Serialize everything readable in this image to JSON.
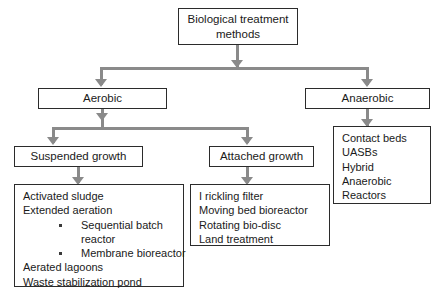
{
  "diagram": {
    "root": {
      "label": "Biological treatment\nmethods",
      "line1": "Biological treatment",
      "line2": "methods"
    },
    "branches": {
      "aerobic": {
        "label": "Aerobic"
      },
      "anaerobic": {
        "label": "Anaerobic"
      }
    },
    "aerobic_children": {
      "suspended": {
        "label": "Suspended growth"
      },
      "attached": {
        "label": "Attached growth"
      }
    },
    "suspended_growth_items": [
      {
        "text": "Activated sludge",
        "bullet": false
      },
      {
        "text": "Extended aeration",
        "bullet": false
      },
      {
        "text": "Sequential batch",
        "bullet": true
      },
      {
        "text": "reactor",
        "bullet": false,
        "continuation": true
      },
      {
        "text": "Membrane bioreactor",
        "bullet": true
      },
      {
        "text": "Aerated lagoons",
        "bullet": false
      },
      {
        "text": "Waste stabilization pond",
        "bullet": false
      }
    ],
    "attached_growth_items": [
      {
        "text": "I rickling filter",
        "bullet": false
      },
      {
        "text": "Moving bed bioreactor",
        "bullet": false
      },
      {
        "text": "Rotating bio-disc",
        "bullet": false
      },
      {
        "text": "Land treatment",
        "bullet": false
      }
    ],
    "anaerobic_items": [
      {
        "text": "Contact beds",
        "bullet": false
      },
      {
        "text": "UASBs",
        "bullet": false
      },
      {
        "text": "Hybrid",
        "bullet": false
      },
      {
        "text": "Anaerobic",
        "bullet": false
      },
      {
        "text": "Reactors",
        "bullet": false
      }
    ],
    "colors": {
      "connector": "#8a8a8a",
      "border": "#2b2b2b",
      "text": "#1a1a1a",
      "background": "#ffffff"
    }
  }
}
